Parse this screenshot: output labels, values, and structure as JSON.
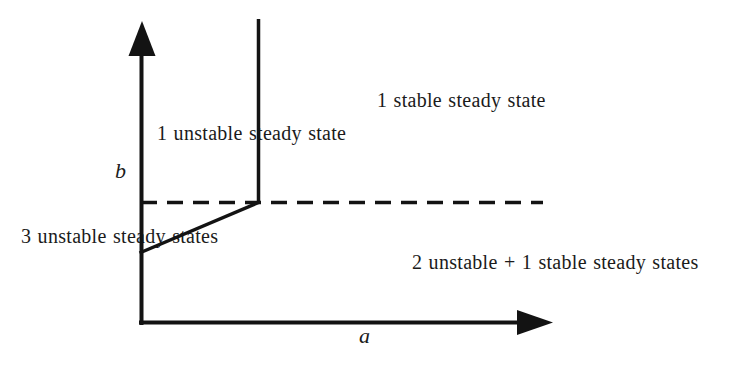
{
  "diagram": {
    "kind": "bifurcation-phase-diagram",
    "background_color": "#ffffff",
    "line_color": "#131313",
    "text_color": "#1b1b1b",
    "axes": {
      "x_label": "a",
      "y_label": "b"
    },
    "regions": {
      "upper_left": "1 unstable steady state",
      "upper_right": "1 stable steady state",
      "lower_left": "3 unstable steady states",
      "lower_right": "2 unstable + 1 stable steady states"
    },
    "boundaries": {
      "vertical_line_style": "solid",
      "horizontal_line_style": "dashed",
      "diagonal_line_style": "solid"
    }
  }
}
